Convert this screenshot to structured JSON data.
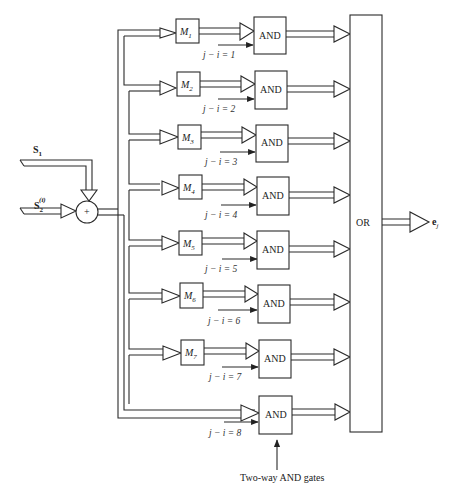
{
  "diagram": {
    "inputs": {
      "s1": {
        "main": "S",
        "sub": "1"
      },
      "s2": {
        "main": "S",
        "sub": "2",
        "sup": "(i)"
      }
    },
    "adder": {
      "symbol": "+"
    },
    "m_blocks": [
      {
        "main": "M",
        "sub": "1"
      },
      {
        "main": "M",
        "sub": "2"
      },
      {
        "main": "M",
        "sub": "3"
      },
      {
        "main": "M",
        "sub": "4"
      },
      {
        "main": "M",
        "sub": "5"
      },
      {
        "main": "M",
        "sub": "6"
      },
      {
        "main": "M",
        "sub": "7"
      }
    ],
    "and_gates": [
      {
        "label": "AND",
        "condition": "j − i = 1"
      },
      {
        "label": "AND",
        "condition": "j − i = 2"
      },
      {
        "label": "AND",
        "condition": "j − i = 3"
      },
      {
        "label": "AND",
        "condition": "j − i = 4"
      },
      {
        "label": "AND",
        "condition": "j − i = 5"
      },
      {
        "label": "AND",
        "condition": "j − i = 6"
      },
      {
        "label": "AND",
        "condition": "j − i = 7"
      },
      {
        "label": "AND",
        "condition": "j − i = 8"
      }
    ],
    "or_gate": {
      "label": "OR"
    },
    "output": {
      "main": "e",
      "sub": "j"
    },
    "annotation": "Two-way AND gates"
  }
}
